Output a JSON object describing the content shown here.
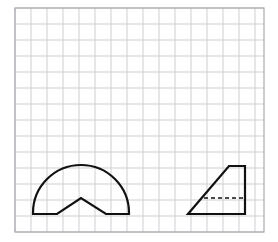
{
  "page": {
    "background_color": "#ffffff",
    "width": 278,
    "height": 242
  },
  "grid": {
    "name": "square-grid",
    "origin_x": 15,
    "origin_y": 8,
    "cell_size": 16,
    "columns": 15.6,
    "rows": 14,
    "right": 264,
    "bottom": 232,
    "line_color": "#c9c9cf",
    "line_width": 0.9,
    "border_color": "#a8a8b0",
    "border_width": 1.2
  },
  "figures": [
    {
      "name": "semicircle-with-notch",
      "label": "Semicircle with V-shaped notch removed from base",
      "stroke_color": "#111111",
      "stroke_width": 2.2,
      "fill": "none",
      "baseline_y": 214,
      "left_base_x": 33,
      "right_base_x": 129,
      "center_x": 81,
      "radius": 48,
      "arc_top_y": 166,
      "notch_apex_x": 81,
      "notch_apex_y": 198,
      "notch_left_x": 57,
      "notch_right_x": 106,
      "path": "M 33 214 L 33 213 A 48 48 0 0 1 129 213 L 129 214 L 106 214 L 81 198 L 57 214 Z"
    },
    {
      "name": "right-trapezoid-with-dashed-line",
      "label": "Right trapezoid with interior dashed horizontal segment",
      "stroke_color": "#111111",
      "stroke_width": 2.2,
      "fill": "none",
      "vertices": [
        {
          "name": "bottom-left",
          "x": 188,
          "y": 214
        },
        {
          "name": "bottom-right",
          "x": 245,
          "y": 214
        },
        {
          "name": "top-right",
          "x": 245,
          "y": 166
        },
        {
          "name": "top-left",
          "x": 229,
          "y": 166
        }
      ],
      "path": "M 188 214 L 245 214 L 245 166 L 229 166 Z",
      "dashed_segment": {
        "name": "interior-dashed-line",
        "x1": 204,
        "y1": 198,
        "x2": 245,
        "y2": 198,
        "stroke_color": "#111111",
        "stroke_width": 1.6,
        "dash_pattern": "4 3"
      }
    }
  ]
}
